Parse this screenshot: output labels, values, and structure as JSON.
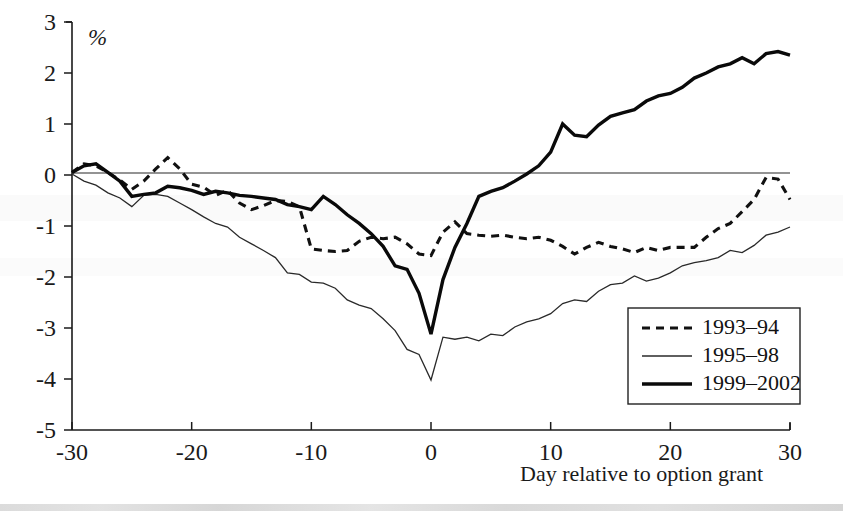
{
  "chart_data": {
    "type": "line",
    "title": "",
    "xlabel": "Day relative to option grant",
    "ylabel": "%",
    "xlim": [
      -30,
      30
    ],
    "ylim": [
      -5,
      3
    ],
    "grid": false,
    "legend_position": "bottom-right",
    "xticks": [
      "-30",
      "-20",
      "-10",
      "0",
      "10",
      "20",
      "30"
    ],
    "xtick_values": [
      -30,
      -20,
      -10,
      0,
      10,
      20,
      30
    ],
    "yticks": [
      "3",
      "2",
      "1",
      "0",
      "-1",
      "-2",
      "-3",
      "-4",
      "-5"
    ],
    "ytick_values": [
      3,
      2,
      1,
      0,
      -1,
      -2,
      -3,
      -4,
      -5
    ],
    "zero_line": 0,
    "x": [
      -30,
      -29,
      -28,
      -27,
      -26,
      -25,
      -24,
      -23,
      -22,
      -21,
      -20,
      -19,
      -18,
      -17,
      -16,
      -15,
      -14,
      -13,
      -12,
      -11,
      -10,
      -9,
      -8,
      -7,
      -6,
      -5,
      -4,
      -3,
      -2,
      -1,
      0,
      1,
      2,
      3,
      4,
      5,
      6,
      7,
      8,
      9,
      10,
      11,
      12,
      13,
      14,
      15,
      16,
      17,
      18,
      19,
      20,
      21,
      22,
      23,
      24,
      25,
      26,
      27,
      28,
      29,
      30
    ],
    "series": [
      {
        "name": "1993-94",
        "style": "dashed",
        "values": [
          0.05,
          0.22,
          0.18,
          0.05,
          -0.1,
          -0.28,
          -0.12,
          0.12,
          0.34,
          0.12,
          -0.18,
          -0.24,
          -0.4,
          -0.3,
          -0.55,
          -0.68,
          -0.6,
          -0.5,
          -0.52,
          -0.62,
          -1.45,
          -1.48,
          -1.5,
          -1.48,
          -1.3,
          -1.22,
          -1.25,
          -1.22,
          -1.35,
          -1.55,
          -1.58,
          -1.12,
          -0.92,
          -1.15,
          -1.18,
          -1.2,
          -1.18,
          -1.22,
          -1.25,
          -1.22,
          -1.28,
          -1.4,
          -1.55,
          -1.42,
          -1.32,
          -1.4,
          -1.45,
          -1.52,
          -1.42,
          -1.48,
          -1.42,
          -1.42,
          -1.42,
          -1.22,
          -1.05,
          -0.95,
          -0.72,
          -0.48,
          -0.05,
          -0.08,
          -0.48
        ]
      },
      {
        "name": "1995-98",
        "style": "thin",
        "values": [
          0.02,
          -0.12,
          -0.2,
          -0.35,
          -0.45,
          -0.62,
          -0.4,
          -0.38,
          -0.42,
          -0.55,
          -0.68,
          -0.82,
          -0.95,
          -1.02,
          -1.22,
          -1.35,
          -1.48,
          -1.62,
          -1.92,
          -1.95,
          -2.1,
          -2.12,
          -2.22,
          -2.45,
          -2.55,
          -2.62,
          -2.82,
          -3.05,
          -3.42,
          -3.52,
          -4.02,
          -3.18,
          -3.22,
          -3.18,
          -3.25,
          -3.12,
          -3.15,
          -2.98,
          -2.88,
          -2.82,
          -2.72,
          -2.52,
          -2.45,
          -2.48,
          -2.28,
          -2.15,
          -2.12,
          -1.98,
          -2.08,
          -2.02,
          -1.92,
          -1.78,
          -1.72,
          -1.68,
          -1.62,
          -1.48,
          -1.52,
          -1.38,
          -1.18,
          -1.12,
          -1.02
        ]
      },
      {
        "name": "1999-2002",
        "style": "thick",
        "values": [
          0.05,
          0.18,
          0.22,
          0.05,
          -0.12,
          -0.42,
          -0.38,
          -0.35,
          -0.22,
          -0.25,
          -0.3,
          -0.38,
          -0.32,
          -0.35,
          -0.4,
          -0.42,
          -0.45,
          -0.48,
          -0.58,
          -0.62,
          -0.68,
          -0.42,
          -0.58,
          -0.78,
          -0.95,
          -1.15,
          -1.4,
          -1.78,
          -1.85,
          -2.32,
          -3.12,
          -2.05,
          -1.42,
          -0.95,
          -0.42,
          -0.32,
          -0.25,
          -0.12,
          0.02,
          0.18,
          0.45,
          1.0,
          0.78,
          0.75,
          0.98,
          1.15,
          1.22,
          1.28,
          1.45,
          1.55,
          1.6,
          1.72,
          1.9,
          2.0,
          2.12,
          2.18,
          2.3,
          2.18,
          2.38,
          2.42,
          2.35
        ]
      }
    ]
  },
  "axis": {
    "y_unit_label": "%",
    "x_axis_title": "Day relative to option grant"
  },
  "legend": {
    "entries": [
      {
        "label": "1993–94",
        "style": "dashed"
      },
      {
        "label": "1995–98",
        "style": "thin"
      },
      {
        "label": "1999–2002",
        "style": "thick"
      }
    ]
  }
}
